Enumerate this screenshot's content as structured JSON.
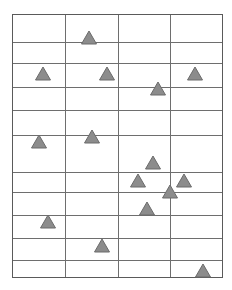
{
  "figure": {
    "title": "",
    "width": 232,
    "height": 290,
    "background_color": "#ffffff"
  },
  "grid": {
    "line_color": "#6e6e6e",
    "line_width": 1,
    "outer_border_color": "#5a5a5a",
    "outer_border_width": 1.2,
    "x_left": 12,
    "x_right": 222,
    "y_top": 14,
    "y_bottom": 277,
    "vertical_lines": [
      12,
      65,
      118,
      170,
      222
    ],
    "horizontal_lines": [
      14,
      42,
      63,
      87,
      110,
      135,
      172,
      192,
      215,
      238,
      260,
      277
    ],
    "columns": 4,
    "rows": 11
  },
  "marker_style": {
    "shape": "triangle-up",
    "fill_color": "#8c8c8c",
    "stroke_color": "#6b6b6b",
    "stroke_width": 1,
    "width": 15,
    "height": 13
  },
  "chart_data": {
    "type": "scatter",
    "title": "",
    "xlabel": "",
    "ylabel": "",
    "grid": true,
    "legend": null,
    "xlim": [
      12,
      222
    ],
    "ylim": [
      14,
      277
    ],
    "marker": "triangle-up",
    "points": [
      {
        "x": 89,
        "y": 44
      },
      {
        "x": 43,
        "y": 80
      },
      {
        "x": 107,
        "y": 80
      },
      {
        "x": 195,
        "y": 80
      },
      {
        "x": 158,
        "y": 95
      },
      {
        "x": 92,
        "y": 143
      },
      {
        "x": 39,
        "y": 148
      },
      {
        "x": 153,
        "y": 169
      },
      {
        "x": 138,
        "y": 187
      },
      {
        "x": 184,
        "y": 187
      },
      {
        "x": 170,
        "y": 198
      },
      {
        "x": 147,
        "y": 215
      },
      {
        "x": 48,
        "y": 228
      },
      {
        "x": 102,
        "y": 252
      },
      {
        "x": 203,
        "y": 277
      }
    ],
    "point_count": 15
  }
}
